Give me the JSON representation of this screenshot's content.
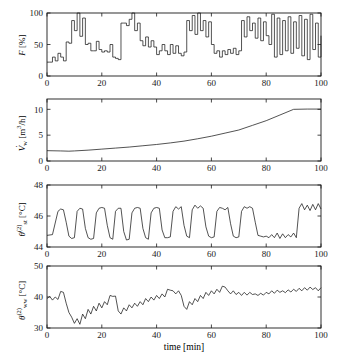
{
  "figure": {
    "xlabel": "time  [min]",
    "x_ticks": [
      0,
      20,
      40,
      60,
      80,
      100
    ],
    "xlim": [
      0,
      100
    ]
  },
  "chart_data": [
    {
      "type": "line",
      "panel": 1,
      "title": "",
      "ylabel": "F [%]",
      "ylabel_parts": {
        "symbol": "F",
        "unit": "[%]"
      },
      "xlabel": "",
      "xlim": [
        0,
        100
      ],
      "ylim": [
        0,
        100
      ],
      "y_ticks": [
        0,
        50,
        100
      ],
      "x_ticks": [
        0,
        20,
        40,
        60,
        80,
        100
      ],
      "grid": false,
      "legend": "none",
      "style": "staircase",
      "description": "Stepped control signal F in percent, increasingly noisy toward 100 min",
      "x": [
        0,
        1,
        2,
        3,
        4,
        5,
        6,
        7,
        8,
        9,
        10,
        11,
        12,
        13,
        14,
        15,
        16,
        17,
        18,
        19,
        20,
        21,
        22,
        23,
        24,
        25,
        26,
        27,
        28,
        29,
        30,
        31,
        32,
        33,
        34,
        35,
        36,
        37,
        38,
        39,
        40,
        41,
        42,
        43,
        44,
        45,
        46,
        47,
        48,
        49,
        50,
        51,
        52,
        53,
        54,
        55,
        56,
        57,
        58,
        59,
        60,
        61,
        62,
        63,
        64,
        65,
        66,
        67,
        68,
        69,
        70,
        71,
        72,
        73,
        74,
        75,
        76,
        77,
        78,
        79,
        80,
        81,
        82,
        83,
        84,
        85,
        86,
        87,
        88,
        89,
        90,
        91,
        92,
        93,
        94,
        95,
        96,
        97,
        98,
        99,
        100
      ],
      "values": [
        22,
        22,
        30,
        24,
        36,
        30,
        24,
        54,
        52,
        88,
        72,
        100,
        63,
        92,
        50,
        52,
        40,
        40,
        55,
        42,
        38,
        40,
        38,
        50,
        30,
        28,
        26,
        84,
        84,
        80,
        90,
        100,
        72,
        84,
        56,
        48,
        62,
        46,
        56,
        46,
        34,
        40,
        50,
        40,
        34,
        50,
        36,
        48,
        36,
        32,
        38,
        88,
        72,
        96,
        66,
        100,
        72,
        88,
        62,
        86,
        50,
        36,
        40,
        30,
        40,
        34,
        42,
        36,
        44,
        34,
        40,
        88,
        62,
        94,
        72,
        84,
        60,
        92,
        56,
        86,
        64,
        50,
        98,
        30,
        92,
        34,
        88,
        40,
        94,
        36,
        86,
        44,
        96,
        32,
        90,
        26,
        98,
        42,
        84,
        30,
        64
      ]
    },
    {
      "type": "line",
      "panel": 2,
      "title": "",
      "ylabel": "V̇w [m³/h]",
      "ylabel_parts": {
        "symbol": "V",
        "dot": true,
        "subscript": "w",
        "unit": "[m3/h]"
      },
      "xlabel": "",
      "xlim": [
        0,
        100
      ],
      "ylim": [
        0,
        12
      ],
      "y_ticks": [
        0,
        5,
        10
      ],
      "x_ticks": [
        0,
        20,
        40,
        60,
        80,
        100
      ],
      "grid": false,
      "legend": "none",
      "style": "smooth",
      "description": "Water volume flow rate rising from 2 to 10 m3/h, saturating after 90 min",
      "x": [
        0,
        5,
        8,
        10,
        15,
        20,
        25,
        30,
        35,
        40,
        45,
        50,
        55,
        60,
        65,
        70,
        75,
        80,
        85,
        90,
        95,
        100
      ],
      "values": [
        2.0,
        1.95,
        1.9,
        1.95,
        2.1,
        2.3,
        2.5,
        2.7,
        2.95,
        3.2,
        3.5,
        3.85,
        4.3,
        4.8,
        5.4,
        6.0,
        6.9,
        7.8,
        8.9,
        10.0,
        10.05,
        10.05
      ]
    },
    {
      "type": "line",
      "panel": 3,
      "title": "",
      "ylabel": "θst(2) [°C]",
      "ylabel_parts": {
        "symbol": "θ",
        "subscript": "st",
        "superscript": "(2)",
        "unit": "[°C]"
      },
      "xlabel": "",
      "xlim": [
        0,
        100
      ],
      "ylim": [
        44,
        48
      ],
      "y_ticks": [
        44,
        46,
        48
      ],
      "x_ticks": [
        0,
        20,
        40,
        60,
        80,
        100
      ],
      "grid": false,
      "legend": "none",
      "style": "square-oscillation",
      "description": "Storage tank temperature cycling between 44.6 and 46.6 C, noisy trough near 80-90 min, elevated noisy plateau after 90 min",
      "x": [
        0,
        2,
        4,
        5,
        6,
        7,
        8,
        9,
        10,
        11,
        12,
        13,
        14,
        15,
        16,
        17,
        18,
        19,
        20,
        21,
        22,
        23,
        24,
        25,
        26,
        27,
        28,
        29,
        30,
        31,
        32,
        33,
        34,
        35,
        36,
        37,
        38,
        39,
        40,
        41,
        42,
        43,
        44,
        45,
        46,
        47,
        48,
        49,
        50,
        51,
        52,
        53,
        54,
        55,
        56,
        57,
        58,
        59,
        60,
        61,
        62,
        63,
        64,
        65,
        66,
        67,
        68,
        69,
        70,
        71,
        72,
        73,
        74,
        75,
        76,
        77,
        78,
        79,
        80,
        81,
        82,
        83,
        84,
        85,
        86,
        87,
        88,
        89,
        90,
        91,
        92,
        93,
        94,
        95,
        96,
        97,
        98,
        99,
        100
      ],
      "values": [
        44.75,
        44.8,
        46.3,
        46.45,
        46.4,
        45.6,
        44.7,
        44.55,
        44.6,
        46.3,
        46.5,
        46.45,
        45.2,
        44.6,
        44.5,
        44.55,
        46.2,
        46.5,
        46.55,
        46.5,
        45.4,
        44.6,
        44.5,
        46.3,
        46.5,
        46.5,
        45.0,
        44.45,
        44.5,
        46.2,
        46.5,
        46.55,
        46.5,
        45.2,
        44.6,
        44.5,
        46.2,
        46.5,
        46.55,
        46.5,
        45.1,
        44.6,
        44.6,
        44.65,
        46.3,
        46.6,
        46.45,
        46.6,
        45.4,
        44.7,
        44.6,
        46.4,
        46.7,
        46.5,
        46.65,
        46.5,
        45.3,
        44.7,
        44.6,
        44.65,
        46.3,
        46.55,
        46.5,
        46.4,
        46.55,
        45.5,
        44.7,
        44.6,
        44.65,
        46.3,
        46.6,
        46.5,
        46.6,
        46.5,
        45.6,
        44.75,
        44.7,
        44.65,
        44.7,
        44.6,
        44.8,
        44.6,
        44.9,
        44.55,
        44.85,
        44.6,
        44.8,
        44.65,
        44.9,
        44.6,
        46.5,
        46.8,
        46.4,
        46.7,
        46.35,
        46.75,
        46.4,
        46.8,
        46.45,
        46.7,
        46.6
      ]
    },
    {
      "type": "line",
      "panel": 4,
      "title": "",
      "ylabel": "θww(2) [°C]",
      "ylabel_parts": {
        "symbol": "θ",
        "subscript": "ww",
        "superscript": "(2)",
        "unit": "[°C]"
      },
      "xlabel": "time  [min]",
      "xlim": [
        0,
        100
      ],
      "ylim": [
        30,
        50
      ],
      "y_ticks": [
        30,
        40,
        50
      ],
      "x_ticks": [
        0,
        20,
        40,
        60,
        80,
        100
      ],
      "grid": false,
      "legend": "none",
      "style": "noisy-drift",
      "description": "Hot water outlet temperature, noisy, dipping to 31 C near 10 min then drifting upward to about 43 C",
      "x": [
        0,
        1,
        2,
        3,
        4,
        5,
        6,
        7,
        8,
        9,
        10,
        11,
        12,
        13,
        14,
        15,
        16,
        17,
        18,
        19,
        20,
        21,
        22,
        23,
        24,
        25,
        26,
        27,
        28,
        29,
        30,
        31,
        32,
        33,
        34,
        35,
        36,
        37,
        38,
        39,
        40,
        41,
        42,
        43,
        44,
        45,
        46,
        47,
        48,
        49,
        50,
        51,
        52,
        53,
        54,
        55,
        56,
        57,
        58,
        59,
        60,
        61,
        62,
        63,
        64,
        65,
        66,
        67,
        68,
        69,
        70,
        71,
        72,
        73,
        74,
        75,
        76,
        77,
        78,
        79,
        80,
        81,
        82,
        83,
        84,
        85,
        86,
        87,
        88,
        89,
        90,
        91,
        92,
        93,
        94,
        95,
        96,
        97,
        98,
        99,
        100
      ],
      "values": [
        39.5,
        40.2,
        39.0,
        40.0,
        39.2,
        41.8,
        41.5,
        38.0,
        35.0,
        33.5,
        31.5,
        33.0,
        31.2,
        34.5,
        33.0,
        36.0,
        34.5,
        37.0,
        35.5,
        38.0,
        36.5,
        38.5,
        37.5,
        40.5,
        40.2,
        40.3,
        35.5,
        34.5,
        36.5,
        35.5,
        37.5,
        36.5,
        38.0,
        37.0,
        38.5,
        37.5,
        39.5,
        38.5,
        40.0,
        39.0,
        40.5,
        39.5,
        41.0,
        40.0,
        42.5,
        42.2,
        42.0,
        41.0,
        42.0,
        40.5,
        37.0,
        36.0,
        38.5,
        37.5,
        39.5,
        38.5,
        40.5,
        39.5,
        41.5,
        40.5,
        42.0,
        41.0,
        42.5,
        41.5,
        43.5,
        43.2,
        42.0,
        41.0,
        42.0,
        40.8,
        41.5,
        40.5,
        41.5,
        40.6,
        41.5,
        40.8,
        41.0,
        40.5,
        41.2,
        40.6,
        41.5,
        41.0,
        42.0,
        41.2,
        42.2,
        41.5,
        42.0,
        41.4,
        42.3,
        41.6,
        42.5,
        41.8,
        42.8,
        42.0,
        43.0,
        42.2,
        43.2,
        42.4,
        43.0,
        42.0,
        43.0
      ]
    }
  ]
}
